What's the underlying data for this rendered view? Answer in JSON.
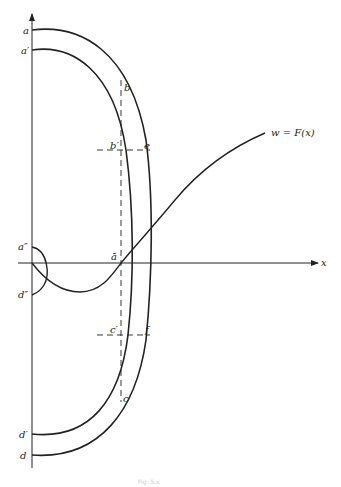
{
  "diagram": {
    "type": "function-graph-with-curve-families",
    "axes": {
      "x_label": "x",
      "origin_px": [
        32,
        263
      ]
    },
    "function_label": "w = F(x)",
    "points": {
      "a": "a",
      "a_prime": "a′",
      "a_double_prime": "a″",
      "a_bar": "ā",
      "b": "b",
      "b_prime": "b′",
      "c": "c",
      "c_prime": "c′",
      "d": "d",
      "d_prime": "d′",
      "d_double_prime": "d″",
      "e": "e",
      "f": "f"
    },
    "caption": "Fig. 5.x"
  }
}
